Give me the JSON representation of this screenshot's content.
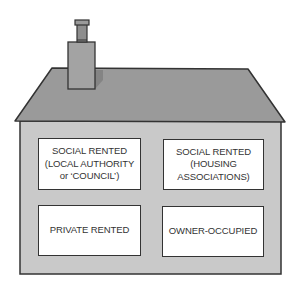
{
  "diagram": {
    "colors": {
      "roof": "#9a9a9a",
      "wall": "#c9c9c9",
      "chimney": "#a3a3a3",
      "outline": "#333333",
      "box_fill": "#ffffff"
    },
    "boxes": [
      {
        "id": "social-rented-council",
        "label": "SOCIAL RENTED\n(LOCAL AUTHORITY\nor ‘COUNCIL’)"
      },
      {
        "id": "social-rented-housing-associations",
        "label": "SOCIAL RENTED\n(HOUSING\nASSOCIATIONS)"
      },
      {
        "id": "private-rented",
        "label": "PRIVATE RENTED"
      },
      {
        "id": "owner-occupied",
        "label": "OWNER-OCCUPIED"
      }
    ]
  }
}
